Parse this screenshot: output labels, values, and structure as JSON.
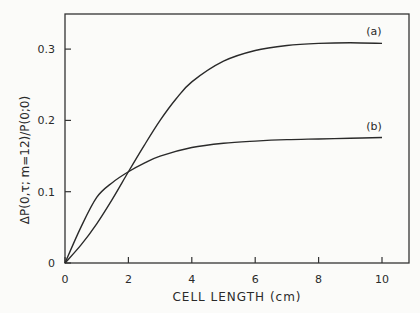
{
  "chart_data": {
    "type": "line",
    "title": "",
    "xlabel": "CELL LENGTH (cm)",
    "ylabel": "ΔP(0,τ; m=12)/P(0;0)",
    "xlim": [
      0,
      11
    ],
    "ylim": [
      0,
      0.35
    ],
    "xticks": [
      0,
      2,
      4,
      6,
      8,
      10
    ],
    "xtick_labels": [
      "0",
      "2",
      "4",
      "6",
      "8",
      "10"
    ],
    "yticks": [
      0,
      0.1,
      0.2,
      0.3
    ],
    "ytick_labels": [
      "0",
      "0.1",
      "0.2",
      "0.3"
    ],
    "grid": false,
    "legend": "inline labels at curve ends",
    "series": [
      {
        "name": "(a)",
        "x": [
          0,
          0.5,
          1,
          1.5,
          2,
          2.5,
          3,
          3.5,
          4,
          5,
          6,
          7,
          8,
          9,
          10
        ],
        "values": [
          0,
          0.025,
          0.055,
          0.09,
          0.128,
          0.165,
          0.2,
          0.23,
          0.254,
          0.283,
          0.298,
          0.305,
          0.308,
          0.309,
          0.308
        ]
      },
      {
        "name": "(b)",
        "x": [
          0,
          0.5,
          1,
          1.5,
          2,
          2.5,
          3,
          4,
          5,
          6,
          7,
          8,
          9,
          10
        ],
        "values": [
          0,
          0.05,
          0.092,
          0.113,
          0.128,
          0.14,
          0.15,
          0.162,
          0.168,
          0.171,
          0.173,
          0.174,
          0.175,
          0.176
        ]
      }
    ]
  }
}
